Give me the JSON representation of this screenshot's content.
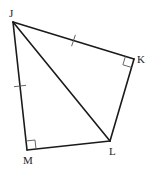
{
  "diagram": {
    "type": "geometry",
    "vertices": [
      {
        "id": "J",
        "label": "J",
        "x": 13,
        "y": 22,
        "label_x": 9,
        "label_y": 17
      },
      {
        "id": "K",
        "label": "K",
        "x": 134,
        "y": 59,
        "label_x": 137,
        "label_y": 63
      },
      {
        "id": "L",
        "label": "L",
        "x": 110,
        "y": 141,
        "label_x": 109,
        "label_y": 155
      },
      {
        "id": "M",
        "label": "M",
        "x": 27,
        "y": 150,
        "label_x": 23,
        "label_y": 164
      }
    ],
    "segments": [
      {
        "id": "JK",
        "from": "J",
        "to": "K"
      },
      {
        "id": "KL",
        "from": "K",
        "to": "L"
      },
      {
        "id": "LM",
        "from": "L",
        "to": "M"
      },
      {
        "id": "MJ",
        "from": "M",
        "to": "J"
      },
      {
        "id": "JL",
        "from": "J",
        "to": "L",
        "kind": "diagonal"
      }
    ],
    "congruence_marks": [
      {
        "segment": "JK",
        "ticks": 1
      },
      {
        "segment": "JM",
        "ticks": 1
      }
    ],
    "right_angles": [
      "K",
      "M"
    ],
    "colors": {
      "line": "#1a1a1a",
      "marks": "#555555",
      "background": "#ffffff"
    }
  }
}
